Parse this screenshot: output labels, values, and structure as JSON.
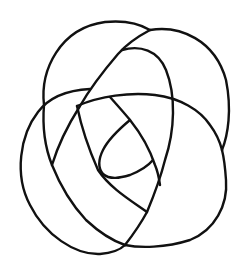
{
  "diagram": {
    "type": "knot-diagram",
    "background_color": "#ffffff",
    "stroke_color": "#111111",
    "strands": [
      {
        "id": "top-left-arc",
        "path": "M44,105 C40,70 60,28 105,22 C125,20 140,24 150,30"
      },
      {
        "id": "top-right-arc",
        "path": "M150,30 C180,25 215,40 226,80 C232,110 228,135 222,150"
      },
      {
        "id": "left-loop",
        "path": "M90,89 C70,90 50,96 38,112 C20,135 14,175 30,205 C45,235 75,255 100,254 C112,253 120,250 125,245"
      },
      {
        "id": "bottom-right-arc",
        "path": "M125,245 C140,248 165,248 190,240 C215,230 228,205 226,180 C225,165 224,158 222,150"
      },
      {
        "id": "long-diagonal",
        "path": "M150,30 C135,38 125,46 118,54 C100,75 88,92 80,106 C68,125 58,145 52,165"
      },
      {
        "id": "inner-right-curve",
        "path": "M122,50 C140,45 158,50 166,70 C176,95 175,130 165,160 C160,180 152,200 147,212 C140,225 132,236 125,245"
      },
      {
        "id": "middle-arc",
        "path": "M77,106 C100,96 130,92 155,95 C180,98 200,110 210,125 C216,133 220,142 222,150"
      },
      {
        "id": "inner-left-line",
        "path": "M77,106 C82,130 90,152 98,170 C110,188 130,200 147,212"
      },
      {
        "id": "center-diagonal",
        "path": "M110,97 C118,106 126,115 130,120 C142,135 150,150 155,165 C158,172 159,178 160,185"
      },
      {
        "id": "eye-top",
        "path": "M130,120 C118,130 108,140 103,150 C98,160 98,168 103,174"
      },
      {
        "id": "eye-bottom",
        "path": "M103,174 C110,180 120,178 130,175 C140,171 148,166 153,160"
      },
      {
        "id": "outer-left-lower",
        "path": "M44,105 C42,130 46,150 52,165 C60,185 72,205 86,220 C100,233 113,241 125,245"
      }
    ]
  }
}
